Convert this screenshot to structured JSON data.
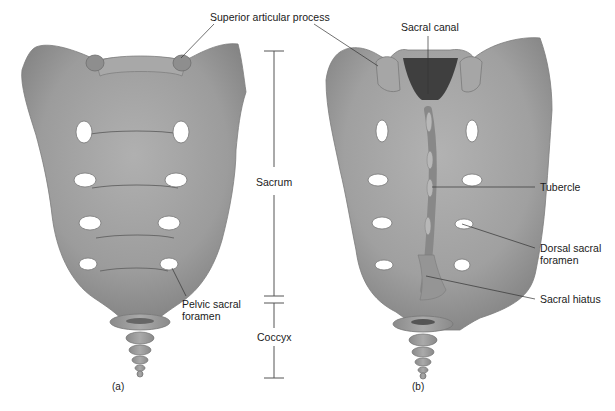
{
  "figure": {
    "colors": {
      "bone": "#9a9a9a",
      "bone_light": "#b4b4b4",
      "bone_dark": "#7a7a7a",
      "foramen": "#ffffff",
      "leader_line": "#333333",
      "text": "#1a1a1a",
      "background": "#ffffff"
    },
    "panels": [
      {
        "id": "a",
        "tag": "(a)",
        "view": "anterior"
      },
      {
        "id": "b",
        "tag": "(b)",
        "view": "posterior"
      }
    ],
    "labels": {
      "superior_articular_process": "Superior articular process",
      "sacral_canal": "Sacral canal",
      "sacrum": "Sacrum",
      "coccyx": "Coccyx",
      "pelvic_sacral_foramen_line1": "Pelvic sacral",
      "pelvic_sacral_foramen_line2": "foramen",
      "tubercle": "Tubercle",
      "dorsal_sacral_foramen_line1": "Dorsal sacral",
      "dorsal_sacral_foramen_line2": "foramen",
      "sacral_hiatus": "Sacral hiatus"
    }
  }
}
